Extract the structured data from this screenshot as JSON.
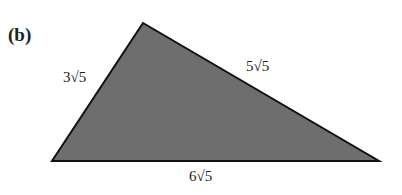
{
  "part_label": "(b)",
  "triangle": {
    "vertices": {
      "top": [
        143,
        23
      ],
      "bottom_left": [
        52,
        161
      ],
      "bottom_right": [
        379,
        161
      ]
    },
    "fill_color": "#6e6e6e",
    "stroke_color": "#111111",
    "sides": {
      "left": "3√5",
      "right": "5√5",
      "bottom": "6√5"
    }
  }
}
